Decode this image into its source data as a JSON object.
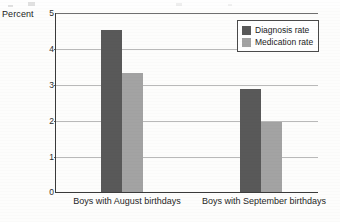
{
  "axis_title": "Percent",
  "legend": {
    "items": [
      {
        "label": "Diagnosis rate",
        "swatch": "diagnosis-swatch",
        "color": "#595959"
      },
      {
        "label": "Medication rate",
        "swatch": "medication-swatch",
        "color": "#a3a3a3"
      }
    ]
  },
  "y_ticks": [
    "0",
    "1",
    "2",
    "3",
    "4",
    "5"
  ],
  "chart_data": {
    "type": "bar",
    "title": "",
    "subtitle": "",
    "xlabel": "",
    "ylabel": "Percent",
    "ylim": [
      0,
      5
    ],
    "y_ticks": [
      0,
      1,
      2,
      3,
      4,
      5
    ],
    "grid": true,
    "legend_position": "top-right",
    "categories": [
      "Boys with August birthdays",
      "Boys with September birthdays"
    ],
    "series": [
      {
        "name": "Diagnosis rate",
        "color": "#595959",
        "values": [
          4.5,
          2.85
        ]
      },
      {
        "name": "Medication rate",
        "color": "#a3a3a3",
        "values": [
          3.3,
          1.95
        ]
      }
    ]
  }
}
